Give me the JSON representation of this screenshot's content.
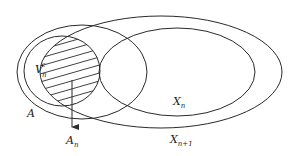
{
  "diagram": {
    "type": "set-diagram",
    "stroke_color": "#2a2a2a",
    "background": "#ffffff",
    "sets": [
      {
        "id": "A",
        "label": "A"
      },
      {
        "id": "V",
        "label_base": "V",
        "label_sub": "n",
        "label_sup": "c"
      },
      {
        "id": "Xn",
        "label_base": "X",
        "label_sub": "n"
      },
      {
        "id": "Xn1",
        "label_base": "X",
        "label_sub": "n+1"
      }
    ],
    "hatched_region": {
      "label_base": "A",
      "label_sub": "n",
      "description": "intersection of V_n^c and X_{n+1}"
    },
    "arrow": {
      "from": "hatched_region",
      "to": "A_n label"
    }
  }
}
